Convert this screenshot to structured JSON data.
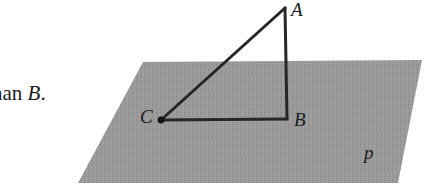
{
  "figure": {
    "caption_fragment": {
      "text_before": "han ",
      "italic_point": "B",
      "text_after": "."
    },
    "plane": {
      "label": "p",
      "fill_color": "#9e9e9e",
      "texture": "stipple-gray",
      "corners": [
        {
          "x": 143,
          "y": 62
        },
        {
          "x": 422,
          "y": 60
        },
        {
          "x": 398,
          "y": 183
        },
        {
          "x": 78,
          "y": 183
        }
      ]
    },
    "triangle": {
      "stroke_color": "#262626",
      "vertices": [
        {
          "name": "A",
          "label": "A",
          "x": 285,
          "y": 8
        },
        {
          "name": "B",
          "label": "B",
          "x": 287,
          "y": 119
        },
        {
          "name": "C",
          "label": "C",
          "x": 161,
          "y": 120
        }
      ],
      "edges": [
        {
          "name": "CA",
          "from": "C",
          "to": "A"
        },
        {
          "name": "AB",
          "from": "A",
          "to": "B"
        },
        {
          "name": "CB",
          "from": "C",
          "to": "B"
        }
      ],
      "point_markers": [
        {
          "name": "C",
          "x": 161,
          "y": 120,
          "radius": 3.4
        }
      ]
    }
  }
}
